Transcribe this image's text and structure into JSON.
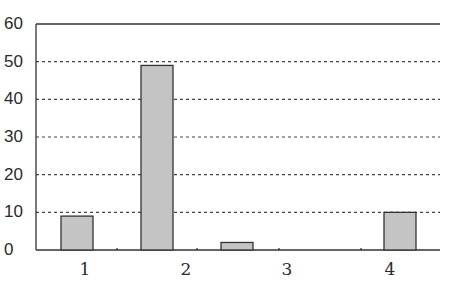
{
  "chart_data": {
    "type": "bar",
    "title": "",
    "xlabel": "",
    "ylabel": "",
    "categories": [
      "1",
      "2",
      "3",
      "4"
    ],
    "values": [
      9,
      49,
      2,
      10
    ],
    "ylim": [
      0,
      60
    ],
    "yticks": [
      0,
      10,
      20,
      30,
      40,
      50,
      60
    ],
    "ytick_labels": [
      "0",
      "10",
      "20",
      "30",
      "40",
      "50",
      "60"
    ],
    "grid": {
      "y": true,
      "style": "dotted"
    },
    "legend": null,
    "colors": {
      "bar_fill": "#c4c4c4",
      "bar_edge": "#333333",
      "grid": "#444444",
      "axis": "#333333"
    }
  }
}
